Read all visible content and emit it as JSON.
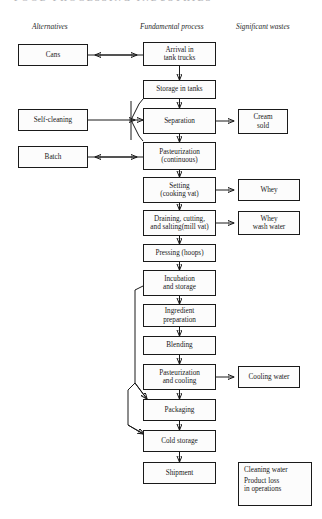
{
  "running_head": "FOOD PROCESSING INDUSTRIES",
  "columns": [
    {
      "label": "Alternatives"
    },
    {
      "label": "Fundamental process"
    },
    {
      "label": "Significant wastes"
    }
  ],
  "alternatives": [
    {
      "label": "Cans"
    },
    {
      "label": "Self-cleaning"
    },
    {
      "label": "Batch"
    }
  ],
  "process": [
    {
      "label": "Arrival in\ntank trucks"
    },
    {
      "label": "Storage in tanks"
    },
    {
      "label": "Separation"
    },
    {
      "label": "Pasteurization\n(continuous)"
    },
    {
      "label": "Setting\n(cooking vat)"
    },
    {
      "label": "Draining, cutting,\nand salting(mill vat)"
    },
    {
      "label": "Pressing (hoops)"
    },
    {
      "label": "Incubation\nand storage"
    },
    {
      "label": "Ingredient\npreparation"
    },
    {
      "label": "Blending"
    },
    {
      "label": "Pasteurization\nand cooling"
    },
    {
      "label": "Packaging"
    },
    {
      "label": "Cold storage"
    },
    {
      "label": "Shipment"
    }
  ],
  "wastes": [
    {
      "label": "Cream\nsold"
    },
    {
      "label": "Whey"
    },
    {
      "label": "Whey\nwash water"
    },
    {
      "label": "Cooling water"
    }
  ],
  "waste_summary": [
    {
      "label": "Cleaning water"
    },
    {
      "label": "Product loss\nin operations"
    }
  ]
}
